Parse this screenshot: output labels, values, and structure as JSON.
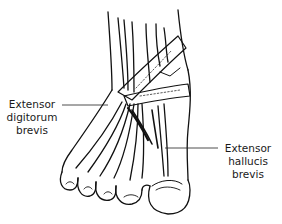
{
  "figure": {
    "labels": [
      {
        "id": "extensor-digitorum-brevis",
        "lines": [
          "Extensor",
          "digitorum",
          "brevis"
        ],
        "side": "left"
      },
      {
        "id": "extensor-hallucis-brevis",
        "lines": [
          "Extensor",
          "hallucis",
          "brevis"
        ],
        "side": "right"
      }
    ],
    "colors": {
      "line": "#111111",
      "background": "#ffffff"
    }
  }
}
